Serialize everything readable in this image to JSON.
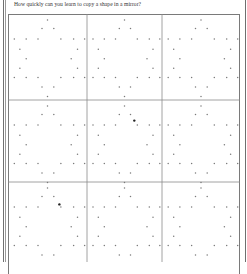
{
  "worksheet": {
    "title": "How quickly can you learn to copy a shape in a mirror?",
    "grid": {
      "columns": 3,
      "rows_visible": 3,
      "cells": [
        {
          "row": 1,
          "col": 1,
          "shape": "six-pointed star dot outline"
        },
        {
          "row": 1,
          "col": 2,
          "shape": "six-pointed star dot outline"
        },
        {
          "row": 1,
          "col": 3,
          "shape": "six-pointed star dot outline"
        },
        {
          "row": 2,
          "col": 1,
          "shape": "six-pointed star dot outline"
        },
        {
          "row": 2,
          "col": 2,
          "shape": "six-pointed star dot outline",
          "marked_dot": true
        },
        {
          "row": 2,
          "col": 3,
          "shape": "six-pointed star dot outline"
        },
        {
          "row": 3,
          "col": 1,
          "shape": "six-pointed star dot outline",
          "marked_dot": true
        },
        {
          "row": 3,
          "col": 2,
          "shape": "six-pointed star dot outline"
        },
        {
          "row": 3,
          "col": 3,
          "shape": "six-pointed star dot outline"
        }
      ]
    },
    "colors": {
      "dot": "#7a7a7a",
      "marked_dot": "#222222",
      "grid_line": "#8a8a8a"
    }
  }
}
